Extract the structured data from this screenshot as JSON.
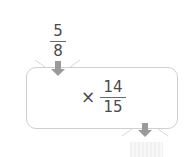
{
  "diagram": {
    "input_fraction": {
      "numerator": "5",
      "denominator": "8"
    },
    "operation": {
      "operator": "×",
      "fraction": {
        "numerator": "14",
        "denominator": "15"
      }
    },
    "output": {
      "value": ""
    },
    "colors": {
      "arrow": "#9a9a9a",
      "box_border": "#cfcfcf",
      "text": "#4a4a4a",
      "answer_fill": "#f3f3f3"
    }
  }
}
